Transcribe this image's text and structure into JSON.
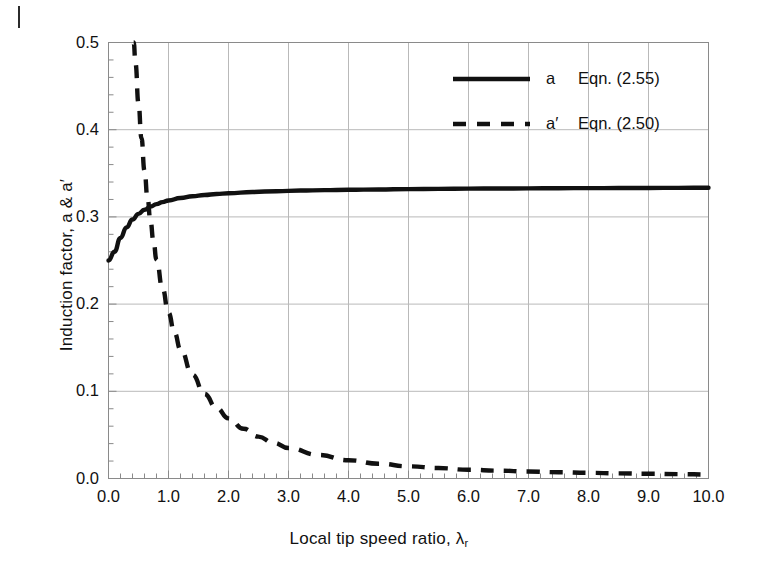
{
  "figure": {
    "margin_mark": "page-margin-rule",
    "background_color": "#ffffff",
    "line_color": "#111111",
    "grid_color": "#b9b9b9",
    "frame_color": "#8a8a8a"
  },
  "chart_data": {
    "type": "line",
    "title": "",
    "xlabel": "Local tip speed ratio, λ",
    "xlabel_sub": "r",
    "ylabel": "Induction factor, a & a′",
    "xlim": [
      0.0,
      10.0
    ],
    "ylim": [
      0.0,
      0.5
    ],
    "grid": true,
    "x_major_step": 1.0,
    "x_minor_step": 0.2,
    "y_major_step": 0.1,
    "y_minor_step": 0.02,
    "xticks": [
      "0.0",
      "1.0",
      "2.0",
      "3.0",
      "4.0",
      "5.0",
      "6.0",
      "7.0",
      "8.0",
      "9.0",
      "10.0"
    ],
    "yticks": [
      "0.0",
      "0.1",
      "0.2",
      "0.3",
      "0.4",
      "0.5"
    ],
    "legend_position": "top-right-inside",
    "series": [
      {
        "name": "a  Eqn. (2.55)",
        "label_main": "a",
        "label_eqn": "Eqn. (2.55)",
        "style": "solid",
        "color": "#111111",
        "width": 4,
        "x": [
          0.0,
          0.1,
          0.2,
          0.3,
          0.4,
          0.5,
          0.6,
          0.7,
          0.8,
          0.9,
          1.0,
          1.2,
          1.4,
          1.6,
          1.8,
          2.0,
          2.4,
          2.8,
          3.2,
          3.6,
          4.0,
          4.5,
          5.0,
          5.5,
          6.0,
          6.5,
          7.0,
          7.5,
          8.0,
          8.5,
          9.0,
          9.5,
          10.0
        ],
        "y": [
          0.25,
          0.26,
          0.276,
          0.288,
          0.297,
          0.3035,
          0.3082,
          0.3118,
          0.3147,
          0.317,
          0.3188,
          0.3216,
          0.3236,
          0.3251,
          0.3263,
          0.3272,
          0.3286,
          0.3295,
          0.3302,
          0.3307,
          0.3311,
          0.3315,
          0.3319,
          0.3321,
          0.3324,
          0.3326,
          0.3327,
          0.3329,
          0.333,
          0.3331,
          0.3332,
          0.3333,
          0.3334
        ]
      },
      {
        "name": "a′ Eqn. (2.50)",
        "label_main": "a′",
        "label_eqn": "Eqn. (2.50)",
        "style": "dashed",
        "color": "#111111",
        "width": 4,
        "dash": "13,10",
        "x": [
          0.42,
          0.45,
          0.5,
          0.55,
          0.6,
          0.65,
          0.7,
          0.75,
          0.8,
          0.9,
          1.0,
          1.1,
          1.2,
          1.4,
          1.6,
          1.8,
          2.0,
          2.25,
          2.5,
          2.75,
          3.0,
          3.5,
          4.0,
          4.5,
          5.0,
          5.5,
          6.0,
          6.5,
          7.0,
          7.5,
          8.0,
          8.5,
          9.0,
          9.5,
          10.0
        ],
        "y": [
          0.5,
          0.476,
          0.43,
          0.39,
          0.353,
          0.322,
          0.295,
          0.272,
          0.251,
          0.218,
          0.19,
          0.167,
          0.148,
          0.119,
          0.097,
          0.081,
          0.069,
          0.057,
          0.048,
          0.041,
          0.035,
          0.027,
          0.021,
          0.017,
          0.014,
          0.012,
          0.01,
          0.009,
          0.008,
          0.0072,
          0.0065,
          0.0059,
          0.0054,
          0.005,
          0.0046
        ]
      }
    ]
  },
  "legend": {
    "items": [
      {
        "swatch": "solid-line-swatch",
        "main": "a",
        "eqn": "Eqn. (2.55)"
      },
      {
        "swatch": "dashed-line-swatch",
        "main": "a′",
        "eqn": "Eqn. (2.50)"
      }
    ]
  }
}
